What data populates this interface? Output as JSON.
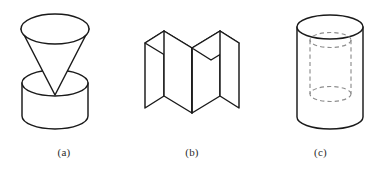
{
  "plate": {
    "background_color": "#ffffff",
    "stroke_color": "#1a1a1a",
    "hidden_stroke_color": "#8d8d8d",
    "figure_count": 3
  },
  "figures": [
    {
      "id": "a",
      "caption": "(a)",
      "description": "Inverted cone resting apex-down on a cylinder",
      "parts": [
        {
          "name": "cone",
          "orientation": "apex-down",
          "visible_lines": "solid"
        },
        {
          "name": "cylinder",
          "orientation": "upright",
          "visible_lines": "solid"
        }
      ]
    },
    {
      "id": "b",
      "caption": "(b)",
      "description": "Two rectangular prisms joined along a central vertical edge forming a V notch",
      "parts": [
        {
          "name": "left-block",
          "visible_lines": "solid"
        },
        {
          "name": "right-block",
          "visible_lines": "solid"
        }
      ]
    },
    {
      "id": "c",
      "caption": "(c)",
      "description": "Cylinder containing a concentric hidden inner cylinder shown with dashed lines",
      "parts": [
        {
          "name": "outer-cylinder",
          "visible_lines": "solid"
        },
        {
          "name": "inner-cylinder",
          "visible_lines": "dashed-hidden"
        }
      ]
    }
  ]
}
